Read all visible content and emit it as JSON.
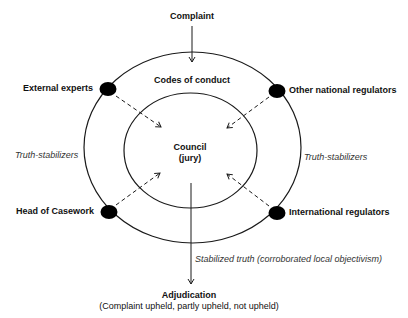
{
  "diagram": {
    "top_input": "Complaint",
    "outer_ring_label": "Codes of conduct",
    "center": {
      "title": "Council",
      "subtitle": "(jury)"
    },
    "nodes": [
      {
        "label": "External experts",
        "position": "top-left"
      },
      {
        "label": "Other national regulators",
        "position": "top-right"
      },
      {
        "label": "Head of Casework",
        "position": "bottom-left"
      },
      {
        "label": "International regulators",
        "position": "bottom-right"
      }
    ],
    "side_labels": {
      "left": "Truth-stabilizers",
      "right": "Truth-stabilizers"
    },
    "output_arrow_label": "Stabilized truth (corroborated local objectivism)",
    "output": {
      "title": "Adjudication",
      "subtitle": "(Complaint upheld, partly upheld, not upheld)"
    },
    "colors": {
      "line": "#1a1a1a",
      "node": "#000000",
      "background": "#ffffff"
    }
  }
}
